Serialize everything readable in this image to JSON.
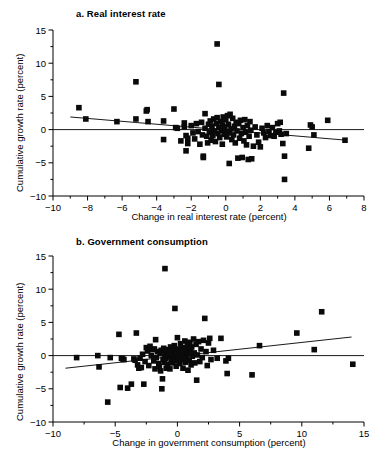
{
  "figure": {
    "background": "#ffffff",
    "marker_color": "#0a0a0a",
    "axis_color": "#000000"
  },
  "chart_data": [
    {
      "type": "scatter",
      "id": "panel-a",
      "title": "a. Real interest rate",
      "xlabel": "Change in real interest rate (percent)",
      "ylabel": "Cumulative growth rate (percent)",
      "xlim": [
        -10,
        8
      ],
      "ylim": [
        -10,
        15
      ],
      "xticks": [
        -10,
        -8,
        -6,
        -4,
        -2,
        0,
        2,
        4,
        6,
        8
      ],
      "xtick_labels": [
        "-10",
        "-8",
        "-6",
        "-4",
        "-2",
        "0",
        "2",
        "4",
        "6",
        "8"
      ],
      "yticks": [
        -10,
        -5,
        0,
        5,
        10,
        15
      ],
      "ytick_labels": [
        "-10",
        "-5",
        "0",
        "5",
        "10",
        "15"
      ],
      "minor_xticks": [
        -9,
        -7,
        -5,
        -3,
        -1,
        1,
        3,
        5,
        7
      ],
      "minor_yticks": [
        -7.5,
        -2.5,
        2.5,
        7.5,
        12.5
      ],
      "grid": false,
      "legend": null,
      "zero_reference_line": {
        "y": 0,
        "from_x": -10,
        "to_x": 8
      },
      "fit_line": {
        "x0": -9.0,
        "y0": 1.9,
        "x1": 7.0,
        "y1": -1.6,
        "slope": -0.219,
        "intercept": -0.07
      },
      "points": [
        [
          -8.5,
          3.3
        ],
        [
          -8.1,
          1.6
        ],
        [
          -6.3,
          1.2
        ],
        [
          -5.2,
          7.2
        ],
        [
          -5.2,
          1.6
        ],
        [
          -4.6,
          2.8
        ],
        [
          -4.55,
          3.0
        ],
        [
          -4.5,
          1.2
        ],
        [
          -3.6,
          1.3
        ],
        [
          -3.6,
          -1.5
        ],
        [
          -3.0,
          3.1
        ],
        [
          -2.9,
          0.3
        ],
        [
          -2.8,
          0.2
        ],
        [
          -2.6,
          -1.7
        ],
        [
          -2.4,
          1.0
        ],
        [
          -2.4,
          0.4
        ],
        [
          -2.3,
          -0.9
        ],
        [
          -2.3,
          -3.2
        ],
        [
          -2.2,
          -1.3
        ],
        [
          -2.2,
          -2.1
        ],
        [
          -2.0,
          0.6
        ],
        [
          -1.9,
          -0.5
        ],
        [
          -1.8,
          -1.4
        ],
        [
          -1.7,
          0.9
        ],
        [
          -1.6,
          -0.3
        ],
        [
          -1.5,
          -2.2
        ],
        [
          -1.4,
          1.1
        ],
        [
          -1.35,
          -0.8
        ],
        [
          -1.3,
          -4.0
        ],
        [
          -1.3,
          -4.2
        ],
        [
          -1.2,
          2.4
        ],
        [
          -1.2,
          0.2
        ],
        [
          -1.1,
          -1.0
        ],
        [
          -1.05,
          -2.0
        ],
        [
          -1.0,
          0.8
        ],
        [
          -0.95,
          -0.4
        ],
        [
          -0.9,
          1.3
        ],
        [
          -0.85,
          -1.6
        ],
        [
          -0.8,
          0.5
        ],
        [
          -0.75,
          -0.9
        ],
        [
          -0.7,
          1.6
        ],
        [
          -0.65,
          -0.2
        ],
        [
          -0.6,
          -1.8
        ],
        [
          -0.55,
          0.9
        ],
        [
          -0.5,
          12.9
        ],
        [
          -0.5,
          1.8
        ],
        [
          -0.45,
          -0.6
        ],
        [
          -0.4,
          6.8
        ],
        [
          -0.4,
          0.3
        ],
        [
          -0.35,
          -1.2
        ],
        [
          -0.3,
          1.2
        ],
        [
          -0.25,
          -0.1
        ],
        [
          -0.2,
          0.7
        ],
        [
          -0.2,
          -2.2
        ],
        [
          -0.15,
          1.9
        ],
        [
          -0.1,
          -0.7
        ],
        [
          -0.05,
          0.4
        ],
        [
          0.0,
          1.5
        ],
        [
          0.0,
          -0.3
        ],
        [
          0.05,
          -1.1
        ],
        [
          0.1,
          2.1
        ],
        [
          0.15,
          0.8
        ],
        [
          0.2,
          -0.5
        ],
        [
          0.2,
          -5.1
        ],
        [
          0.25,
          2.3
        ],
        [
          0.3,
          0.1
        ],
        [
          0.35,
          -1.5
        ],
        [
          0.4,
          1.7
        ],
        [
          0.45,
          -0.8
        ],
        [
          0.5,
          0.5
        ],
        [
          0.55,
          -2.0
        ],
        [
          0.6,
          1.1
        ],
        [
          0.65,
          -0.2
        ],
        [
          0.7,
          -4.3
        ],
        [
          0.75,
          0.9
        ],
        [
          0.8,
          -1.3
        ],
        [
          0.85,
          1.4
        ],
        [
          0.9,
          -0.6
        ],
        [
          0.95,
          -4.2
        ],
        [
          1.0,
          0.3
        ],
        [
          1.05,
          -1.7
        ],
        [
          1.1,
          1.5
        ],
        [
          1.15,
          -0.4
        ],
        [
          1.2,
          -2.3
        ],
        [
          1.25,
          0.6
        ],
        [
          1.3,
          -4.5
        ],
        [
          1.35,
          -1.0
        ],
        [
          1.4,
          1.2
        ],
        [
          1.45,
          -0.1
        ],
        [
          1.5,
          -4.4
        ],
        [
          1.6,
          -2.5
        ],
        [
          1.7,
          0.4
        ],
        [
          1.8,
          -0.8
        ],
        [
          1.9,
          -1.9
        ],
        [
          2.0,
          -2.6
        ],
        [
          2.1,
          0.2
        ],
        [
          2.2,
          -0.5
        ],
        [
          2.3,
          -1.2
        ],
        [
          2.4,
          0.6
        ],
        [
          2.5,
          -0.3
        ],
        [
          2.6,
          -0.9
        ],
        [
          2.7,
          0.3
        ],
        [
          2.8,
          -1.0
        ],
        [
          2.9,
          -0.4
        ],
        [
          3.0,
          0.9
        ],
        [
          3.1,
          -0.2
        ],
        [
          3.15,
          1.1
        ],
        [
          3.2,
          -0.7
        ],
        [
          3.3,
          -2.1
        ],
        [
          3.35,
          5.5
        ],
        [
          3.4,
          -4.0
        ],
        [
          3.4,
          -7.5
        ],
        [
          3.5,
          -0.6
        ],
        [
          4.8,
          -2.8
        ],
        [
          4.9,
          0.7
        ],
        [
          5.0,
          0.4
        ],
        [
          5.1,
          -0.8
        ],
        [
          5.9,
          1.4
        ],
        [
          6.9,
          -1.6
        ]
      ]
    },
    {
      "type": "scatter",
      "id": "panel-b",
      "title": "b. Government consumption",
      "xlabel": "Change in government consumption (percent)",
      "ylabel": "Cumulative growth rate (percent)",
      "xlim": [
        -10,
        15
      ],
      "ylim": [
        -10,
        15
      ],
      "xticks": [
        -10,
        -5,
        0,
        5,
        10,
        15
      ],
      "xtick_labels": [
        "-10",
        "-5",
        "0",
        "5",
        "10",
        "15"
      ],
      "yticks": [
        -10,
        -5,
        0,
        5,
        10,
        15
      ],
      "ytick_labels": [
        "-10",
        "-5",
        "0",
        "5",
        "10",
        "15"
      ],
      "minor_xticks": [
        -7.5,
        -2.5,
        2.5,
        7.5,
        12.5
      ],
      "minor_yticks": [
        -7.5,
        -2.5,
        2.5,
        7.5,
        12.5
      ],
      "grid": false,
      "legend": null,
      "zero_reference_line": {
        "y": 0,
        "from_x": -10,
        "to_x": 15
      },
      "fit_line": {
        "x0": -9.0,
        "y0": -1.9,
        "x1": 14.0,
        "y1": 2.8,
        "slope": 0.204,
        "intercept": -0.06
      },
      "points": [
        [
          -8.1,
          -0.3
        ],
        [
          -6.4,
          0.0
        ],
        [
          -6.3,
          -1.7
        ],
        [
          -5.6,
          -7.0
        ],
        [
          -5.4,
          -0.3
        ],
        [
          -4.7,
          3.2
        ],
        [
          -4.6,
          -4.8
        ],
        [
          -4.5,
          -0.4
        ],
        [
          -4.4,
          -0.5
        ],
        [
          -4.3,
          -0.6
        ],
        [
          -4.0,
          -4.9
        ],
        [
          -3.7,
          -4.3
        ],
        [
          -3.5,
          -0.5
        ],
        [
          -3.4,
          -0.7
        ],
        [
          -3.3,
          3.4
        ],
        [
          -3.2,
          -1.4
        ],
        [
          -3.1,
          -1.9
        ],
        [
          -3.0,
          -0.4
        ],
        [
          -2.9,
          -1.8
        ],
        [
          -2.8,
          0.2
        ],
        [
          -2.7,
          -4.3
        ],
        [
          -2.6,
          -0.9
        ],
        [
          -2.5,
          1.2
        ],
        [
          -2.4,
          0.7
        ],
        [
          -2.3,
          -1.5
        ],
        [
          -2.2,
          1.4
        ],
        [
          -2.1,
          0.0
        ],
        [
          -2.0,
          0.9
        ],
        [
          -1.9,
          -0.8
        ],
        [
          -1.85,
          1.0
        ],
        [
          -1.8,
          -2.0
        ],
        [
          -1.75,
          2.4
        ],
        [
          -1.7,
          -0.3
        ],
        [
          -1.6,
          0.6
        ],
        [
          -1.5,
          -1.2
        ],
        [
          -1.45,
          -1.6
        ],
        [
          -1.4,
          0.3
        ],
        [
          -1.35,
          -2.3
        ],
        [
          -1.3,
          0.8
        ],
        [
          -1.25,
          -5.0
        ],
        [
          -1.2,
          -3.5
        ],
        [
          -1.15,
          -0.6
        ],
        [
          -1.1,
          1.1
        ],
        [
          -1.05,
          -1.0
        ],
        [
          -1.0,
          13.1
        ],
        [
          -1.0,
          0.2
        ],
        [
          -0.95,
          -0.4
        ],
        [
          -0.9,
          -1.9
        ],
        [
          -0.85,
          0.5
        ],
        [
          -0.8,
          -1.3
        ],
        [
          -0.75,
          0.9
        ],
        [
          -0.7,
          -0.2
        ],
        [
          -0.65,
          0.1
        ],
        [
          -0.6,
          -2.0
        ],
        [
          -0.55,
          1.3
        ],
        [
          -0.5,
          -0.7
        ],
        [
          -0.45,
          0.4
        ],
        [
          -0.4,
          -1.1
        ],
        [
          -0.35,
          0.7
        ],
        [
          -0.3,
          -0.5
        ],
        [
          -0.25,
          1.5
        ],
        [
          -0.2,
          7.1
        ],
        [
          -0.2,
          -0.1
        ],
        [
          -0.15,
          0.8
        ],
        [
          -0.1,
          -1.6
        ],
        [
          -0.05,
          0.3
        ],
        [
          0.0,
          2.7
        ],
        [
          0.0,
          -0.8
        ],
        [
          0.05,
          1.0
        ],
        [
          0.1,
          -0.3
        ],
        [
          0.15,
          0.6
        ],
        [
          0.2,
          -1.2
        ],
        [
          0.25,
          1.8
        ],
        [
          0.3,
          0.2
        ],
        [
          0.35,
          -0.6
        ],
        [
          0.4,
          1.2
        ],
        [
          0.45,
          -1.9
        ],
        [
          0.5,
          0.5
        ],
        [
          0.55,
          -0.2
        ],
        [
          0.6,
          2.2
        ],
        [
          0.65,
          -1.0
        ],
        [
          0.7,
          0.9
        ],
        [
          0.75,
          -0.4
        ],
        [
          0.8,
          1.6
        ],
        [
          0.85,
          -2.2
        ],
        [
          0.9,
          0.3
        ],
        [
          0.95,
          -0.7
        ],
        [
          1.0,
          2.0
        ],
        [
          1.05,
          0.7
        ],
        [
          1.1,
          -1.4
        ],
        [
          1.15,
          1.3
        ],
        [
          1.2,
          -0.1
        ],
        [
          1.3,
          2.5
        ],
        [
          1.35,
          0.4
        ],
        [
          1.4,
          -1.1
        ],
        [
          1.5,
          1.7
        ],
        [
          1.55,
          -3.7
        ],
        [
          1.6,
          0.1
        ],
        [
          1.7,
          2.1
        ],
        [
          1.8,
          -0.9
        ],
        [
          1.9,
          1.0
        ],
        [
          2.0,
          -0.3
        ],
        [
          2.1,
          2.3
        ],
        [
          2.2,
          5.6
        ],
        [
          2.3,
          0.6
        ],
        [
          2.4,
          -1.5
        ],
        [
          2.5,
          1.9
        ],
        [
          2.6,
          2.6
        ],
        [
          2.7,
          -0.6
        ],
        [
          2.9,
          0.8
        ],
        [
          3.2,
          -0.4
        ],
        [
          3.5,
          2.6
        ],
        [
          3.9,
          -0.8
        ],
        [
          4.0,
          -2.7
        ],
        [
          4.1,
          -0.4
        ],
        [
          6.0,
          -2.9
        ],
        [
          6.6,
          1.5
        ],
        [
          9.6,
          3.4
        ],
        [
          11.0,
          0.9
        ],
        [
          11.6,
          6.6
        ],
        [
          14.1,
          -1.3
        ]
      ]
    }
  ]
}
